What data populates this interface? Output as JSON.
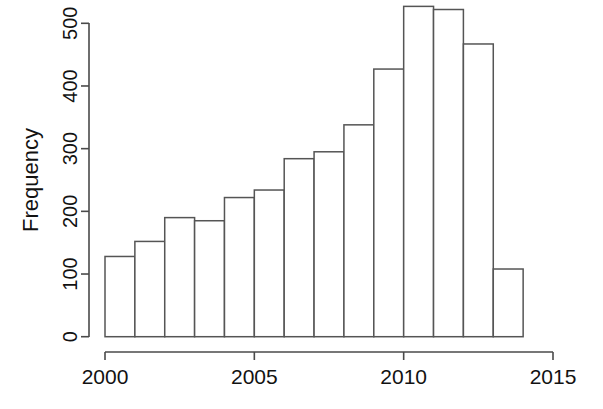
{
  "chart_data": {
    "type": "bar",
    "title": "",
    "subtitle": "",
    "xlabel": "",
    "ylabel": "Frequency",
    "categories": [
      "2000",
      "2001",
      "2002",
      "2003",
      "2004",
      "2005",
      "2006",
      "2007",
      "2008",
      "2009",
      "2010",
      "2011",
      "2012",
      "2013"
    ],
    "bin_edges": [
      2000,
      2001,
      2002,
      2003,
      2004,
      2005,
      2006,
      2007,
      2008,
      2009,
      2010,
      2011,
      2012,
      2013,
      2014
    ],
    "values": [
      128,
      152,
      190,
      185,
      222,
      234,
      284,
      295,
      338,
      427,
      527,
      522,
      467,
      108
    ],
    "x": [
      2000,
      2001,
      2002,
      2003,
      2004,
      2005,
      2006,
      2007,
      2008,
      2009,
      2010,
      2011,
      2012,
      2013
    ],
    "xlim": [
      2000,
      2015
    ],
    "ylim": [
      0,
      500
    ],
    "x_ticks": [
      2000,
      2005,
      2010,
      2015
    ],
    "x_tick_labels": [
      "2000",
      "2005",
      "2010",
      "2015"
    ],
    "y_ticks": [
      0,
      100,
      200,
      300,
      400,
      500
    ],
    "y_tick_labels": [
      "0",
      "100",
      "200",
      "300",
      "400",
      "500"
    ],
    "grid": false,
    "legend": null,
    "bar_fill_color": "#ffffff",
    "bar_border_color": "#555555",
    "axis_color": "#4a4a4a",
    "background_color": "#ffffff"
  }
}
